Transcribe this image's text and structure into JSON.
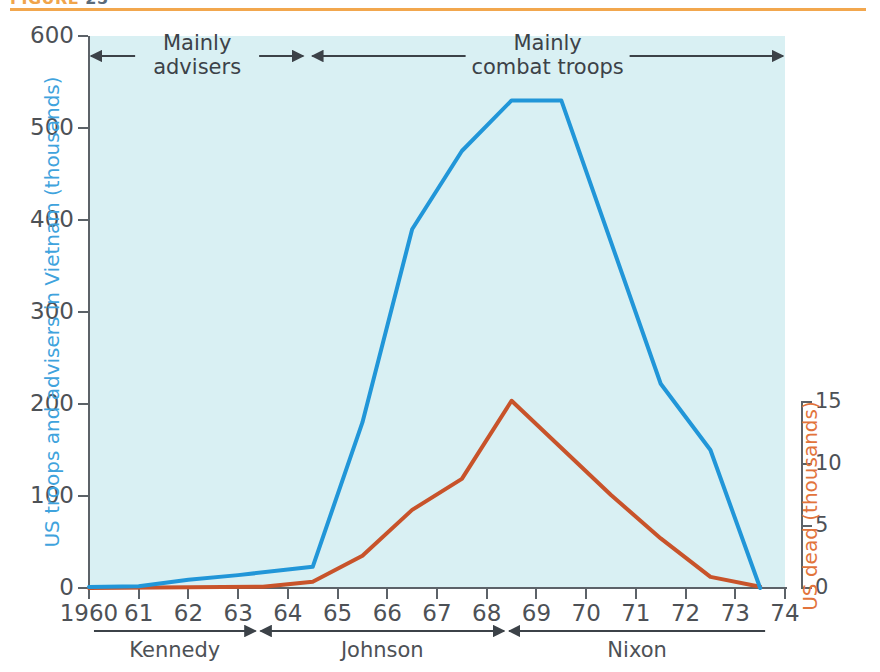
{
  "figure": {
    "caption": "FIGURE",
    "number": "25"
  },
  "chart_data": {
    "type": "line",
    "xlabel": "",
    "x_tick_labels": [
      "1960",
      "61",
      "62",
      "63",
      "64",
      "65",
      "66",
      "67",
      "68",
      "69",
      "70",
      "71",
      "72",
      "73",
      "74"
    ],
    "x_values": [
      1960,
      1961,
      1962,
      1963,
      1964,
      1965,
      1966,
      1967,
      1968,
      1969,
      1970,
      1971,
      1972,
      1973,
      1974
    ],
    "xlim": [
      1960,
      1974
    ],
    "grid": false,
    "legend_position": "none",
    "axes": {
      "left": {
        "label": "US troops and advisers in Vietnam (thousands)",
        "ticks": [
          0,
          100,
          200,
          300,
          400,
          500,
          600
        ],
        "lim": [
          0,
          600
        ],
        "color": "#3fa3dd"
      },
      "right": {
        "label": "US dead (thousands)",
        "ticks": [
          0,
          5,
          10,
          15
        ],
        "lim": [
          0,
          15
        ],
        "color": "#e2743c"
      }
    },
    "series": [
      {
        "name": "US troops and advisers in Vietnam (thousands)",
        "axis": "left",
        "color": "#2196d8",
        "points": [
          {
            "x": 1960.0,
            "y": 1
          },
          {
            "x": 1961.0,
            "y": 2
          },
          {
            "x": 1962.0,
            "y": 9
          },
          {
            "x": 1963.0,
            "y": 14
          },
          {
            "x": 1964.5,
            "y": 23
          },
          {
            "x": 1965.5,
            "y": 180
          },
          {
            "x": 1966.5,
            "y": 390
          },
          {
            "x": 1967.5,
            "y": 475
          },
          {
            "x": 1968.5,
            "y": 530
          },
          {
            "x": 1969.5,
            "y": 530
          },
          {
            "x": 1971.5,
            "y": 222
          },
          {
            "x": 1972.5,
            "y": 150
          },
          {
            "x": 1973.5,
            "y": 0
          }
        ]
      },
      {
        "name": "US dead (thousands)",
        "axis": "right",
        "color": "#c8532a",
        "points": [
          {
            "x": 1960.0,
            "y": 0.0
          },
          {
            "x": 1963.5,
            "y": 0.1
          },
          {
            "x": 1964.5,
            "y": 0.5
          },
          {
            "x": 1965.5,
            "y": 2.6
          },
          {
            "x": 1966.5,
            "y": 6.3
          },
          {
            "x": 1967.5,
            "y": 8.8
          },
          {
            "x": 1968.5,
            "y": 15.1
          },
          {
            "x": 1970.5,
            "y": 7.5
          },
          {
            "x": 1971.5,
            "y": 4.0
          },
          {
            "x": 1972.5,
            "y": 0.9
          },
          {
            "x": 1973.5,
            "y": 0.1
          }
        ]
      }
    ],
    "annotations": [
      {
        "name": "mainly-advisers",
        "text_line1": "Mainly",
        "text_line2": "advisers",
        "x_start": 1960.0,
        "x_end": 1964.35
      },
      {
        "name": "mainly-combat-troops",
        "text_line1": "Mainly",
        "text_line2": "combat troops",
        "x_start": 1964.45,
        "x_end": 1974.0
      }
    ],
    "presidents": [
      {
        "name": "Kennedy",
        "x_start": 1960.1,
        "x_end": 1963.35
      },
      {
        "name": "Johnson",
        "x_start": 1963.45,
        "x_end": 1968.35
      },
      {
        "name": "Nixon",
        "x_start": 1968.45,
        "x_end": 1973.6
      }
    ]
  }
}
